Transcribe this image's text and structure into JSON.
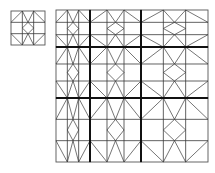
{
  "diagram": {
    "type": "geometric-tiling",
    "background": "#ffffff",
    "line_color": "#3a3a3a",
    "thick_line_color": "#111111",
    "motif": {
      "description": "3x3 grid tile; top row V-zigzag from top-edge third-points to row-1 line, center diamond, bottom row mirrored",
      "grid_fractions": [
        0.3333,
        0.6667
      ],
      "segments": [
        [
          [
            0.3333,
            0
          ],
          [
            0,
            0.3333
          ]
        ],
        [
          [
            0.3333,
            0
          ],
          [
            0.5,
            0.3333
          ]
        ],
        [
          [
            0.6667,
            0
          ],
          [
            0.5,
            0.3333
          ]
        ],
        [
          [
            0.6667,
            0
          ],
          [
            1,
            0.3333
          ]
        ],
        [
          [
            0.5,
            0.3333
          ],
          [
            0.6667,
            0.5
          ]
        ],
        [
          [
            0.6667,
            0.5
          ],
          [
            0.5,
            0.6667
          ]
        ],
        [
          [
            0.5,
            0.6667
          ],
          [
            0.3333,
            0.5
          ]
        ],
        [
          [
            0.3333,
            0.5
          ],
          [
            0.5,
            0.3333
          ]
        ],
        [
          [
            0,
            0.6667
          ],
          [
            0.3333,
            1
          ]
        ],
        [
          [
            0.5,
            0.6667
          ],
          [
            0.3333,
            1
          ]
        ],
        [
          [
            0.5,
            0.6667
          ],
          [
            0.6667,
            1
          ]
        ],
        [
          [
            1,
            0.6667
          ],
          [
            0.6667,
            1
          ]
        ]
      ]
    },
    "small_tile": {
      "label": "base-tile",
      "x": 11,
      "y": 11,
      "width": 34,
      "height": 34
    },
    "large_grid": {
      "label": "scaled-tiling",
      "x": 56,
      "y": 10,
      "column_widths": [
        34,
        51,
        67
      ],
      "row_heights": [
        37,
        51,
        64
      ],
      "thick_dividers": true
    }
  }
}
